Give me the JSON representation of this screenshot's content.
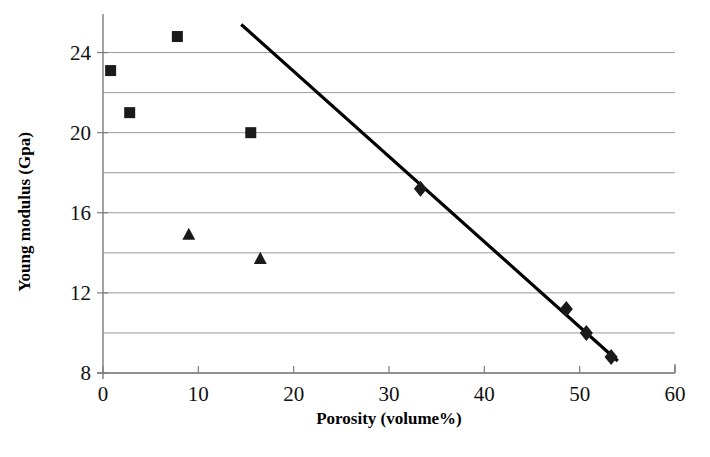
{
  "chart_data": {
    "type": "scatter",
    "title": "",
    "xlabel": "Porosity (volume%)",
    "ylabel": "Young modulus (Gpa)",
    "xlim": [
      0,
      60
    ],
    "ylim": [
      8,
      26
    ],
    "xticks": [
      0,
      10,
      20,
      30,
      40,
      50,
      60
    ],
    "xtick_labels": [
      "0",
      "10",
      "20",
      "30",
      "40",
      "50",
      "60"
    ],
    "yticks": [
      8,
      12,
      16,
      20,
      24
    ],
    "ytick_labels": [
      "8",
      "12",
      "16",
      "20",
      "24"
    ],
    "gridlines_y": [
      10,
      14,
      18,
      22
    ],
    "grid": "horizontal",
    "legend": "none",
    "series": [
      {
        "name": "square-series",
        "marker": "square",
        "color": "#1a1a1a",
        "points": [
          {
            "x": 0.8,
            "y": 23.1
          },
          {
            "x": 2.8,
            "y": 21.0
          },
          {
            "x": 7.8,
            "y": 24.8
          },
          {
            "x": 15.5,
            "y": 20.0
          }
        ]
      },
      {
        "name": "triangle-series",
        "marker": "triangle",
        "color": "#1a1a1a",
        "points": [
          {
            "x": 9.0,
            "y": 14.9
          },
          {
            "x": 16.5,
            "y": 13.7
          }
        ]
      },
      {
        "name": "diamond-series",
        "marker": "diamond",
        "color": "#1a1a1a",
        "points": [
          {
            "x": 33.3,
            "y": 17.2
          },
          {
            "x": 48.6,
            "y": 11.2
          },
          {
            "x": 50.7,
            "y": 10.0
          },
          {
            "x": 53.3,
            "y": 8.8
          }
        ]
      }
    ],
    "trend_line": {
      "name": "fit-line",
      "color": "#000000",
      "start": {
        "x": 14.5,
        "y": 25.4
      },
      "end": {
        "x": 54.0,
        "y": 8.6
      }
    }
  },
  "axes": {
    "x_title": "Porosity (volume%)",
    "y_title": "Young modulus (Gpa)"
  }
}
